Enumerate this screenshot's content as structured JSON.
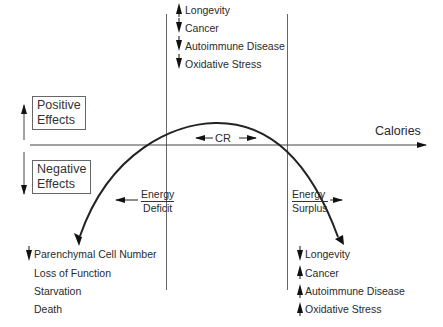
{
  "axis": {
    "x_label": "Calories"
  },
  "positive_effects": {
    "label_line1": "Positive",
    "label_line2": "Effects"
  },
  "negative_effects": {
    "label_line1": "Negative",
    "label_line2": "Effects"
  },
  "cr_label": "CR",
  "energy_deficit": {
    "line1": "Energy",
    "line2": "Deficit"
  },
  "energy_surplus": {
    "line1": "Energy",
    "line2": "Surplus"
  },
  "top_effects": [
    {
      "direction": "up",
      "label": "Longevity"
    },
    {
      "direction": "down",
      "label": "Cancer"
    },
    {
      "direction": "down",
      "label": "Autoimmune Disease"
    },
    {
      "direction": "down",
      "label": "Oxidative Stress"
    }
  ],
  "deficit_effects": [
    {
      "direction": "down",
      "label": "Parenchymal Cell Number"
    },
    {
      "direction": "none",
      "label": "Loss of Function"
    },
    {
      "direction": "none",
      "label": "Starvation"
    },
    {
      "direction": "none",
      "label": "Death"
    }
  ],
  "surplus_effects": [
    {
      "direction": "down",
      "label": "Longevity"
    },
    {
      "direction": "up",
      "label": "Cancer"
    },
    {
      "direction": "up",
      "label": "Autoimmune Disease"
    },
    {
      "direction": "up",
      "label": "Oxidative Stress"
    }
  ]
}
